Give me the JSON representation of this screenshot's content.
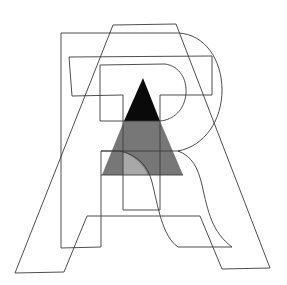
{
  "figure": {
    "letters": [
      "A",
      "R",
      "T"
    ],
    "colors": {
      "background": "#ffffff",
      "stroke": "#3a3a3a",
      "triangle_top": "#0a0a0a",
      "triangle_middle": "#777777",
      "overlap_patch": "#a8a8a8"
    }
  }
}
